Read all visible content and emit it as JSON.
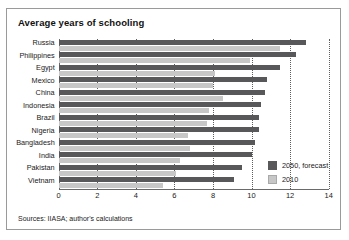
{
  "chart_data": {
    "type": "bar",
    "orientation": "horizontal",
    "title": "Average years of schooling",
    "xlabel": "",
    "ylabel": "",
    "xlim": [
      0,
      14
    ],
    "xticks": [
      0,
      2,
      4,
      6,
      8,
      10,
      12,
      14
    ],
    "xtick_labels": [
      "0",
      "2",
      "4",
      "6",
      "8",
      "10",
      "12",
      "14"
    ],
    "grid": "vertical-dotted",
    "legend_position": "inside-bottom-right",
    "categories": [
      "Russia",
      "Philippines",
      "Egypt",
      "Mexico",
      "China",
      "Indonesia",
      "Brazil",
      "Nigeria",
      "Bangladesh",
      "India",
      "Pakistan",
      "Vietnam"
    ],
    "series": [
      {
        "name": "2050, forecast",
        "color": "#58585a",
        "values": [
          12.8,
          12.3,
          11.5,
          10.8,
          10.7,
          10.5,
          10.4,
          10.4,
          10.2,
          10.0,
          9.5,
          9.1
        ]
      },
      {
        "name": "2010",
        "color": "#c7c7c7",
        "values": [
          11.5,
          9.9,
          8.1,
          8.0,
          8.5,
          7.8,
          7.7,
          6.7,
          6.8,
          6.3,
          6.1,
          5.4
        ]
      }
    ],
    "source_note": "Sources: IIASA; author's calculations"
  },
  "legend": {
    "items": [
      {
        "label": "2050, forecast",
        "swatch": "dark"
      },
      {
        "label": "2010",
        "swatch": "light"
      }
    ]
  },
  "colors": {
    "forecast": "#58585a",
    "baseline": "#c7c7c7",
    "frame": "#9a9a9a",
    "text": "#1a1a1a"
  }
}
